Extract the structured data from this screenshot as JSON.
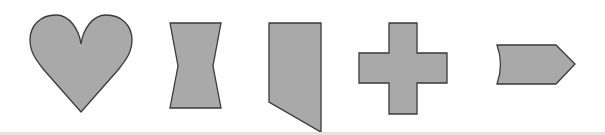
{
  "diagram": {
    "background": "#ffffff",
    "shape_fill": "#a9a9a9",
    "shape_stroke": "#3a3a3a",
    "divider_color": "#e4e4e4",
    "shapes": [
      {
        "name": "heart",
        "label": "heart"
      },
      {
        "name": "hourglass",
        "label": "hourglass"
      },
      {
        "name": "slanted-pentagon",
        "label": "slanted pentagon"
      },
      {
        "name": "cross",
        "label": "cross"
      },
      {
        "name": "chevron-arrow",
        "label": "concave chevron arrow"
      }
    ]
  }
}
